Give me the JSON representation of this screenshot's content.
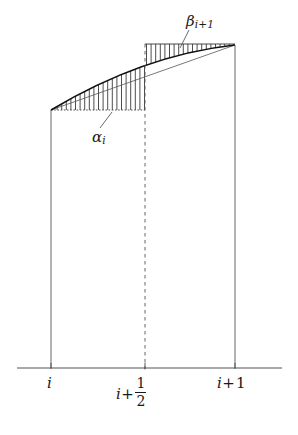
{
  "figure": {
    "kind": "mathematical-diagram",
    "background_color": "#ffffff",
    "line_color": "#1a1a1a",
    "thin_line_color": "#555555",
    "hatch_color": "#3a3a3a"
  },
  "axis": {
    "name": "baseline",
    "y": 368,
    "x_start": 17,
    "x_end": 282,
    "ticks": [
      {
        "id": "tick-i",
        "x": 51
      },
      {
        "id": "tick-i-half",
        "x": 145
      },
      {
        "id": "tick-i-plus-1",
        "x": 235
      }
    ],
    "labels": {
      "left": {
        "text": "i",
        "x": 51,
        "y": 375
      },
      "middle_prefix": "i",
      "middle_operator": "+",
      "middle_numerator": "1",
      "middle_denominator": "2",
      "right_prefix": "i",
      "right_operator": "+",
      "right_value": "1"
    }
  },
  "verticals": [
    {
      "id": "left-vertical",
      "x": 51,
      "y_top": 110,
      "y_bottom": 368,
      "style": "solid"
    },
    {
      "id": "mid-vertical",
      "x": 145,
      "y_top": 44,
      "y_bottom": 373,
      "style": "dashed"
    },
    {
      "id": "right-vertical",
      "x": 235,
      "y_top": 45,
      "y_bottom": 368,
      "style": "solid"
    }
  ],
  "curve": {
    "name": "concave-curve",
    "start": {
      "x": 51,
      "y": 110
    },
    "end": {
      "x": 235,
      "y": 45
    },
    "shape": "concave-down",
    "control": {
      "x": 143,
      "y": 55
    }
  },
  "chord": {
    "name": "straight-chord",
    "start": {
      "x": 51,
      "y": 110
    },
    "end": {
      "x": 235,
      "y": 45
    }
  },
  "regions": [
    {
      "id": "alpha-region",
      "label_base": "α",
      "label_sub": "i",
      "hatch": "vertical",
      "x_start": 51,
      "x_end": 145,
      "bound_top": "curve",
      "bound_bottom_y": 110,
      "label_x": 92,
      "label_y": 130,
      "leader_from": {
        "x": 112,
        "y": 112
      },
      "leader_to": {
        "x": 100,
        "y": 128
      }
    },
    {
      "id": "beta-region",
      "label_base": "β",
      "label_sub": "i+1",
      "hatch": "vertical",
      "x_start": 145,
      "x_end": 235,
      "bound_top_y": 44,
      "bound_bottom": "curve",
      "label_x": 186,
      "label_y": 14,
      "leader_from": {
        "x": 180,
        "y": 48
      },
      "leader_to": {
        "x": 189,
        "y": 30
      }
    }
  ]
}
